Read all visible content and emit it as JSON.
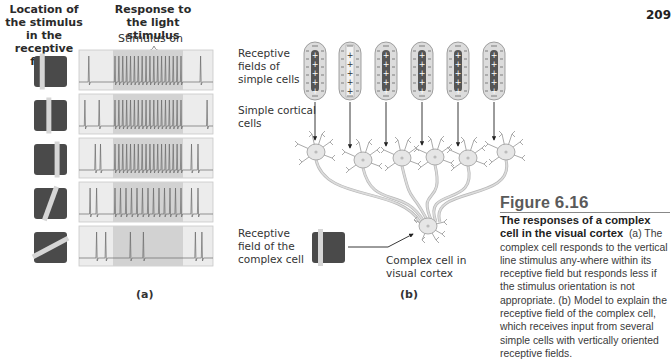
{
  "page_number": "209",
  "panel_a": {
    "header_left": "Location of the stimulus in the receptive field",
    "header_right": "Response to the light stimulus",
    "stimulus_label": "Stimulus on",
    "panel_label": "(a)",
    "rows": [
      {
        "stimulus": "vertical bar left",
        "bar_x": 0.25,
        "angle": 0,
        "spikes_before": [
          0.06
        ],
        "spikes_during": 18,
        "spikes_after": [
          0.92
        ],
        "response": "strong"
      },
      {
        "stimulus": "vertical bar center",
        "bar_x": 0.45,
        "angle": 0,
        "spikes_before": [
          0.03,
          0.14
        ],
        "spikes_during": 18,
        "spikes_after": [
          0.97
        ],
        "response": "strong"
      },
      {
        "stimulus": "vertical bar right",
        "bar_x": 0.7,
        "angle": 0,
        "spikes_before": [
          0.11,
          0.15
        ],
        "spikes_during": 18,
        "spikes_after": [
          0.85,
          0.9
        ],
        "response": "strong"
      },
      {
        "stimulus": "tilted bar",
        "bar_x": 0.5,
        "angle": 20,
        "spikes_before": [
          0.07,
          0.12
        ],
        "spikes_during": 13,
        "spikes_after": [
          0.85,
          0.9
        ],
        "response": "reduced"
      },
      {
        "stimulus": "oblique bar",
        "bar_x": 0.5,
        "angle": 62,
        "spikes_before": [
          0.12,
          0.19
        ],
        "spikes_during_list": [
          0.38,
          0.48
        ],
        "spikes_after": [
          0.88,
          0.93
        ],
        "response": "weak"
      }
    ]
  },
  "panel_b": {
    "label_rf_simple": "Receptive fields of simple cells",
    "label_simple_cells": "Simple cortical cells",
    "label_rf_complex": "Receptive field of the complex cell",
    "label_complex_cell": "Complex cell in visual cortex",
    "panel_label": "(b)",
    "receptive_fields": [
      {
        "type": "on-center",
        "center": "+",
        "surround": "−",
        "count_plus": 5
      },
      {
        "type": "highlighted",
        "center": "+",
        "surround": "−",
        "count_plus": 5
      },
      {
        "type": "on-center",
        "center": "+",
        "surround": "−",
        "count_plus": 5
      },
      {
        "type": "on-center",
        "center": "+",
        "surround": "−",
        "count_plus": 5
      },
      {
        "type": "on-center",
        "center": "+",
        "surround": "−",
        "count_plus": 5
      },
      {
        "type": "on-center",
        "center": "+",
        "surround": "−",
        "count_plus": 5
      }
    ]
  },
  "figure": {
    "label": "Figure",
    "number": "6.16",
    "title": "The responses of a complex cell in the visual cortex",
    "caption": "(a) The complex cell responds to the vertical line stimulus any-where within its receptive field but responds less if the stimulus orientation is not appropriate. (b) Model to explain the receptive field of the complex cell, which receives input from several simple cells with vertically oriented receptive fields."
  },
  "colors": {
    "stimulus_dark": "#4a4a4a",
    "stimulus_bar": "#d6d6d6",
    "trace_bg": "#ececec",
    "stim_window": "#d2d2d2",
    "trace_line": "#6a6a6a",
    "neuron_fill": "#e6e6e6",
    "neuron_stroke": "#9a9a9a"
  }
}
